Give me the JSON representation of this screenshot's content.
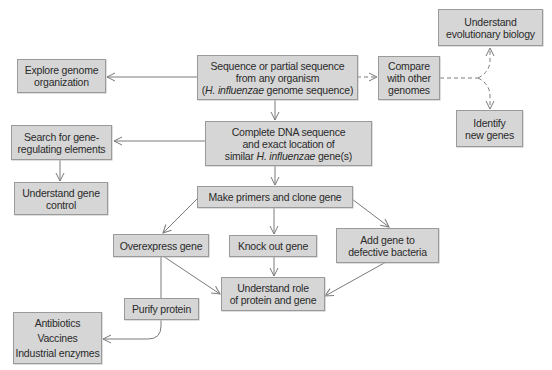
{
  "diagram": {
    "type": "flowchart",
    "colors": {
      "box_fill": "#d6d6d6",
      "box_border": "#9a9a9a",
      "line": "#7a7a7a",
      "text": "#2a2a2a",
      "background": "#ffffff"
    },
    "nodes": {
      "sequence": {
        "lines": [
          "Sequence or partial sequence",
          "from any organism"
        ],
        "line3_prefix": "(",
        "line3_italic": "H. influenzae",
        "line3_suffix": " genome sequence)"
      },
      "explore": {
        "lines": [
          "Explore genome",
          "organization"
        ]
      },
      "compare": {
        "lines": [
          "Compare",
          "with other",
          "genomes"
        ]
      },
      "evolution": {
        "lines": [
          "Understand",
          "evolutionary biology"
        ]
      },
      "identify": {
        "lines": [
          "Identify",
          "new genes"
        ]
      },
      "complete_dna": {
        "lines": [
          "Complete DNA sequence",
          "and exact location of"
        ],
        "line3_prefix": "similar ",
        "line3_italic": "H. influenzae",
        "line3_suffix": " gene(s)"
      },
      "search": {
        "lines": [
          "Search for gene-",
          "regulating elements"
        ]
      },
      "gene_control": {
        "lines": [
          "Understand gene",
          "control"
        ]
      },
      "primers": {
        "lines": [
          "Make primers and clone gene"
        ]
      },
      "overexpress": {
        "lines": [
          "Overexpress gene"
        ]
      },
      "knockout": {
        "lines": [
          "Knock out gene"
        ]
      },
      "add_gene": {
        "lines": [
          "Add gene to",
          "defective bacteria"
        ]
      },
      "role": {
        "lines": [
          "Understand role",
          "of protein and gene"
        ]
      },
      "purify": {
        "lines": [
          "Purify protein"
        ]
      },
      "products": {
        "lines": [
          "Antibiotics",
          "Vaccines",
          "Industrial enzymes"
        ]
      }
    },
    "edges": [
      {
        "from": "sequence",
        "to": "explore",
        "style": "solid"
      },
      {
        "from": "sequence",
        "to": "compare",
        "style": "dashed"
      },
      {
        "from": "compare",
        "to": "evolution",
        "style": "dashed"
      },
      {
        "from": "compare",
        "to": "identify",
        "style": "dashed"
      },
      {
        "from": "sequence",
        "to": "complete_dna",
        "style": "solid"
      },
      {
        "from": "complete_dna",
        "to": "search",
        "style": "solid"
      },
      {
        "from": "search",
        "to": "gene_control",
        "style": "solid"
      },
      {
        "from": "complete_dna",
        "to": "primers",
        "style": "solid"
      },
      {
        "from": "primers",
        "to": "overexpress",
        "style": "solid"
      },
      {
        "from": "primers",
        "to": "knockout",
        "style": "solid"
      },
      {
        "from": "primers",
        "to": "add_gene",
        "style": "solid"
      },
      {
        "from": "overexpress",
        "to": "role",
        "style": "solid"
      },
      {
        "from": "knockout",
        "to": "role",
        "style": "solid"
      },
      {
        "from": "add_gene",
        "to": "role",
        "style": "solid"
      },
      {
        "from": "overexpress",
        "to": "purify",
        "style": "solid"
      },
      {
        "from": "purify",
        "to": "products",
        "style": "solid"
      }
    ]
  }
}
